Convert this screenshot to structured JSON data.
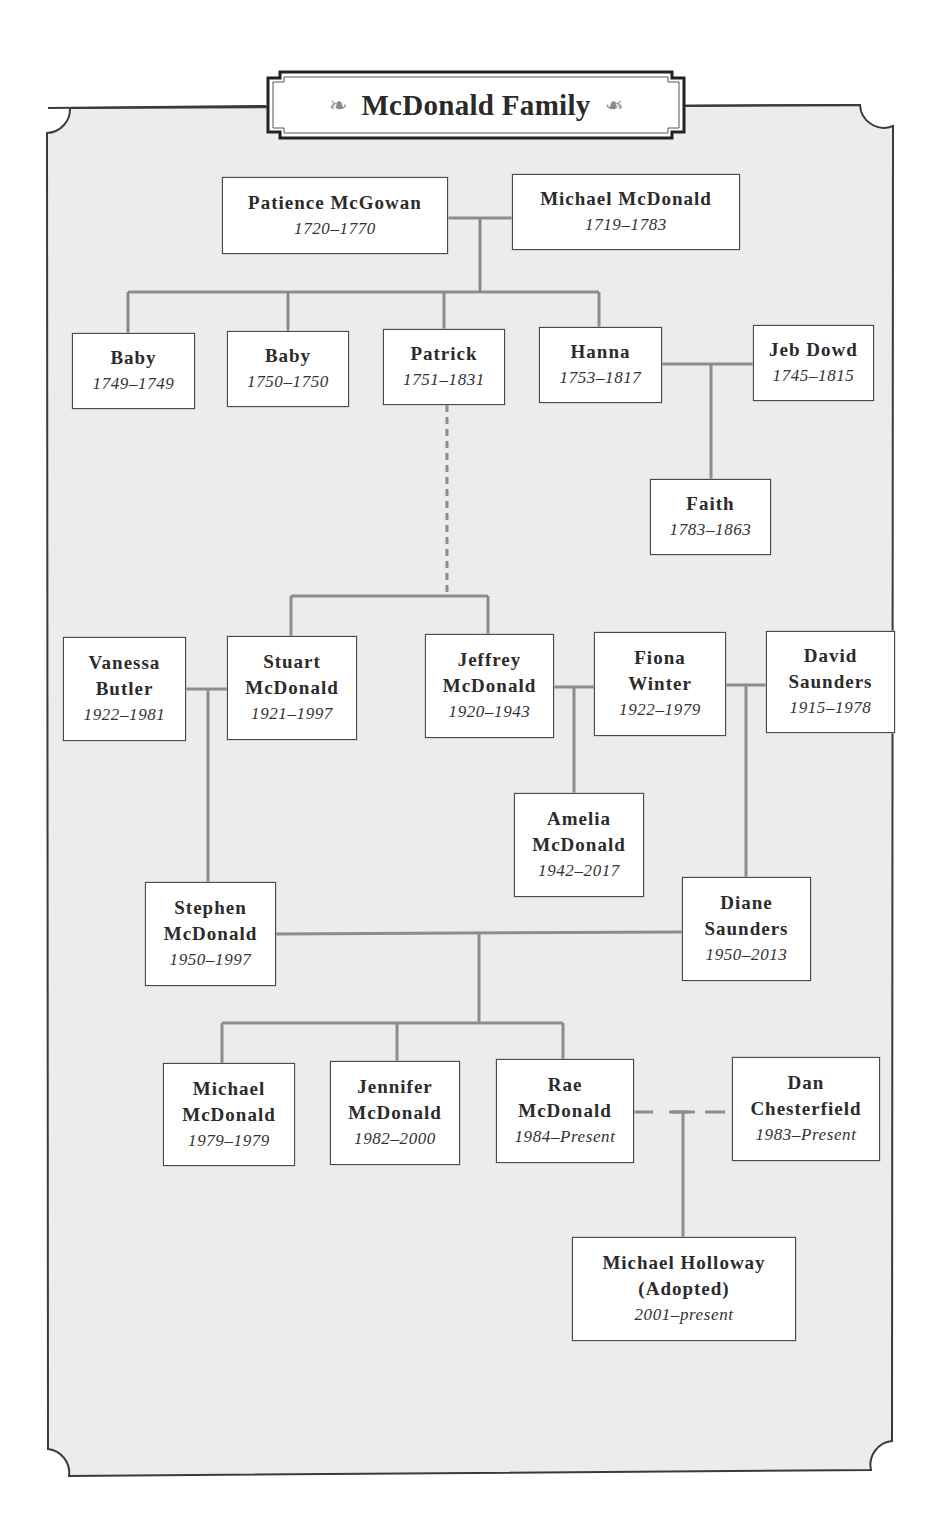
{
  "title": "McDonald Family",
  "colors": {
    "background": "#ececec",
    "frame_border": "#3a3a3a",
    "connector": "#8c8c8c",
    "box_fill": "#ffffff",
    "box_border": "#4a4a4a",
    "text": "#2b2b2b"
  },
  "people": [
    {
      "id": "patience",
      "name": [
        "Patience McGowan"
      ],
      "dates": "1720–1770"
    },
    {
      "id": "michael_sr",
      "name": [
        "Michael McDonald"
      ],
      "dates": "1719–1783"
    },
    {
      "id": "baby1",
      "name": [
        "Baby"
      ],
      "dates": "1749–1749"
    },
    {
      "id": "baby2",
      "name": [
        "Baby"
      ],
      "dates": "1750–1750"
    },
    {
      "id": "patrick",
      "name": [
        "Patrick"
      ],
      "dates": "1751–1831"
    },
    {
      "id": "hanna",
      "name": [
        "Hanna"
      ],
      "dates": "1753–1817"
    },
    {
      "id": "jeb",
      "name": [
        "Jeb Dowd"
      ],
      "dates": "1745–1815"
    },
    {
      "id": "faith",
      "name": [
        "Faith"
      ],
      "dates": "1783–1863"
    },
    {
      "id": "vanessa",
      "name": [
        "Vanessa",
        "Butler"
      ],
      "dates": "1922–1981"
    },
    {
      "id": "stuart",
      "name": [
        "Stuart",
        "McDonald"
      ],
      "dates": "1921–1997"
    },
    {
      "id": "jeffrey",
      "name": [
        "Jeffrey",
        "McDonald"
      ],
      "dates": "1920–1943"
    },
    {
      "id": "fiona",
      "name": [
        "Fiona",
        "Winter"
      ],
      "dates": "1922–1979"
    },
    {
      "id": "david",
      "name": [
        "David",
        "Saunders"
      ],
      "dates": "1915–1978"
    },
    {
      "id": "amelia",
      "name": [
        "Amelia",
        "McDonald"
      ],
      "dates": "1942–2017"
    },
    {
      "id": "stephen",
      "name": [
        "Stephen",
        "McDonald"
      ],
      "dates": "1950–1997"
    },
    {
      "id": "diane",
      "name": [
        "Diane",
        "Saunders"
      ],
      "dates": "1950–2013"
    },
    {
      "id": "michael_jr",
      "name": [
        "Michael",
        "McDonald"
      ],
      "dates": "1979–1979"
    },
    {
      "id": "jennifer",
      "name": [
        "Jennifer",
        "McDonald"
      ],
      "dates": "1982–2000"
    },
    {
      "id": "rae",
      "name": [
        "Rae",
        "McDonald"
      ],
      "dates": "1984–Present"
    },
    {
      "id": "dan",
      "name": [
        "Dan",
        "Chesterfield"
      ],
      "dates": "1983–Present"
    },
    {
      "id": "holloway",
      "name": [
        "Michael Holloway",
        "(Adopted)"
      ],
      "dates": "2001–present"
    }
  ],
  "relationships": [
    {
      "type": "couple",
      "members": [
        "patience",
        "michael_sr"
      ],
      "children": [
        "baby1",
        "baby2",
        "patrick",
        "hanna"
      ]
    },
    {
      "type": "couple",
      "members": [
        "hanna",
        "jeb"
      ],
      "children": [
        "faith"
      ]
    },
    {
      "type": "descendant-dashed",
      "from": "patrick",
      "children": [
        "stuart",
        "jeffrey"
      ]
    },
    {
      "type": "couple",
      "members": [
        "vanessa",
        "stuart"
      ],
      "children": [
        "stephen"
      ]
    },
    {
      "type": "couple",
      "members": [
        "jeffrey",
        "fiona"
      ],
      "children": [
        "amelia"
      ]
    },
    {
      "type": "couple",
      "members": [
        "fiona",
        "david"
      ],
      "children": [
        "diane"
      ]
    },
    {
      "type": "couple",
      "members": [
        "stephen",
        "diane"
      ],
      "children": [
        "michael_jr",
        "jennifer",
        "rae"
      ]
    },
    {
      "type": "partner-dashed",
      "members": [
        "rae",
        "dan"
      ],
      "children": [
        "holloway"
      ]
    }
  ]
}
